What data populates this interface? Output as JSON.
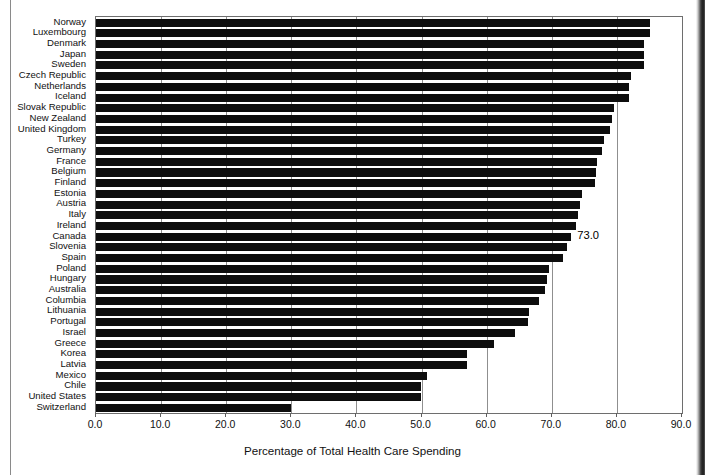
{
  "figure": {
    "name": "horizontal-bar-chart-health-care-spending"
  },
  "chart_data": {
    "type": "bar",
    "orientation": "horizontal",
    "title": "",
    "subtitle": "",
    "xlabel": "Percentage of Total Health Care Spending",
    "ylabel": "",
    "xlim": [
      0.0,
      90.0
    ],
    "xticks": [
      "0.0",
      "10.0",
      "20.0",
      "30.0",
      "40.0",
      "50.0",
      "60.0",
      "70.0",
      "80.0",
      "90.0"
    ],
    "xtick_values": [
      0,
      10,
      20,
      30,
      40,
      50,
      60,
      70,
      80,
      90
    ],
    "grid": "vertical",
    "legend": "none",
    "bar_color": "#0d0d0d",
    "categories": [
      "Norway",
      "Luxembourg",
      "Denmark",
      "Japan",
      "Sweden",
      "Czech Republic",
      "Netherlands",
      "Iceland",
      "Slovak Republic",
      "New Zealand",
      "United Kingdom",
      "Turkey",
      "Germany",
      "France",
      "Belgium",
      "Finland",
      "Estonia",
      "Austria",
      "Italy",
      "Ireland",
      "Canada",
      "Slovenia",
      "Spain",
      "Poland",
      "Hungary",
      "Australia",
      "Columbia",
      "Lithuania",
      "Portugal",
      "Israel",
      "Greece",
      "Korea",
      "Latvia",
      "Mexico",
      "Chile",
      "United States",
      "Switzerland"
    ],
    "values": [
      85.1,
      85.1,
      84.2,
      84.2,
      84.2,
      82.1,
      81.9,
      81.8,
      79.5,
      79.3,
      79.0,
      78.0,
      77.7,
      77.0,
      76.8,
      76.6,
      74.6,
      74.3,
      74.0,
      73.7,
      73.0,
      72.4,
      71.7,
      69.5,
      69.3,
      69.0,
      68.0,
      66.5,
      66.3,
      64.4,
      61.2,
      57.0,
      57.0,
      50.9,
      49.9,
      49.9,
      30.0
    ],
    "annotations": [
      {
        "text": "73.0",
        "category": "Canada",
        "value": 73.0
      }
    ]
  },
  "artifacts": {
    "left_rule": "page-edge-rule",
    "right_band": "scan-shadow-band"
  }
}
